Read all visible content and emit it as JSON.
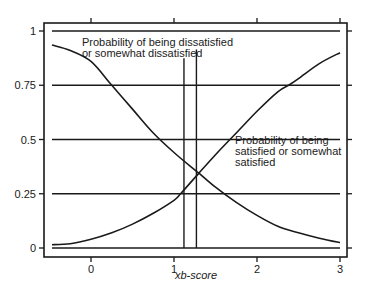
{
  "chart_data": {
    "type": "line",
    "title": "",
    "xlabel": "xb-score",
    "ylabel": "",
    "xlim": [
      -0.57,
      3.07
    ],
    "ylim": [
      -0.04,
      1.04
    ],
    "x_ticks": [
      0,
      1,
      2,
      3
    ],
    "x_tick_labels": [
      "0",
      "1",
      "2",
      "3"
    ],
    "y_ticks": [
      0,
      0.25,
      0.5,
      0.75,
      1
    ],
    "y_tick_labels": [
      "0",
      "0.25",
      "0.5",
      "0.75",
      "1"
    ],
    "grid": true,
    "horizontal_reference_lines": [
      0,
      0.25,
      0.5,
      0.75,
      1
    ],
    "vertical_reference_lines": [
      {
        "x": 1.12,
        "y_top": 0.875
      },
      {
        "x": 1.27,
        "y_top": 0.915
      }
    ],
    "series": [
      {
        "name": "Probability of being dissatisfied or somewhat dissatisfied",
        "x": [
          -0.47,
          -0.25,
          0.0,
          0.25,
          0.5,
          0.75,
          1.0,
          1.25,
          1.3,
          1.5,
          1.75,
          2.0,
          2.25,
          2.5,
          2.75,
          3.0
        ],
        "values": [
          0.935,
          0.91,
          0.86,
          0.75,
          0.64,
          0.53,
          0.44,
          0.36,
          0.345,
          0.28,
          0.21,
          0.15,
          0.1,
          0.07,
          0.045,
          0.025
        ]
      },
      {
        "name": "Probability of being satisfied or somewhat satisfied",
        "x": [
          -0.47,
          -0.25,
          0.0,
          0.25,
          0.5,
          0.75,
          1.0,
          1.08,
          1.3,
          1.5,
          1.75,
          2.0,
          2.25,
          2.38,
          2.5,
          2.75,
          3.0
        ],
        "values": [
          0.015,
          0.02,
          0.04,
          0.07,
          0.11,
          0.16,
          0.22,
          0.25,
          0.345,
          0.43,
          0.53,
          0.63,
          0.72,
          0.75,
          0.78,
          0.85,
          0.9
        ]
      }
    ],
    "annotations": [
      {
        "lines": [
          "Probability of being dissatisfied",
          "or somewhat dissatisfied"
        ],
        "x": -0.18,
        "y": 0.9
      },
      {
        "lines": [
          "Probability of being",
          "satisfied or somewhat",
          "satisfied"
        ],
        "x": 1.55,
        "y": 0.3
      }
    ],
    "legend": "none (inline annotations)"
  }
}
